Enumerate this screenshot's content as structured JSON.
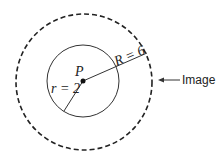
{
  "diagram": {
    "center_label": "P",
    "inner_radius_label": "r = 2",
    "outer_radius_label": "R = 6",
    "callout_label": "Image",
    "colors": {
      "stroke": "#222222",
      "background": "#ffffff"
    },
    "geometry": {
      "center": [
        83,
        81
      ],
      "inner_radius": 36,
      "outer_radius": 68,
      "outer_style": "dashed",
      "inner_style": "solid"
    }
  }
}
